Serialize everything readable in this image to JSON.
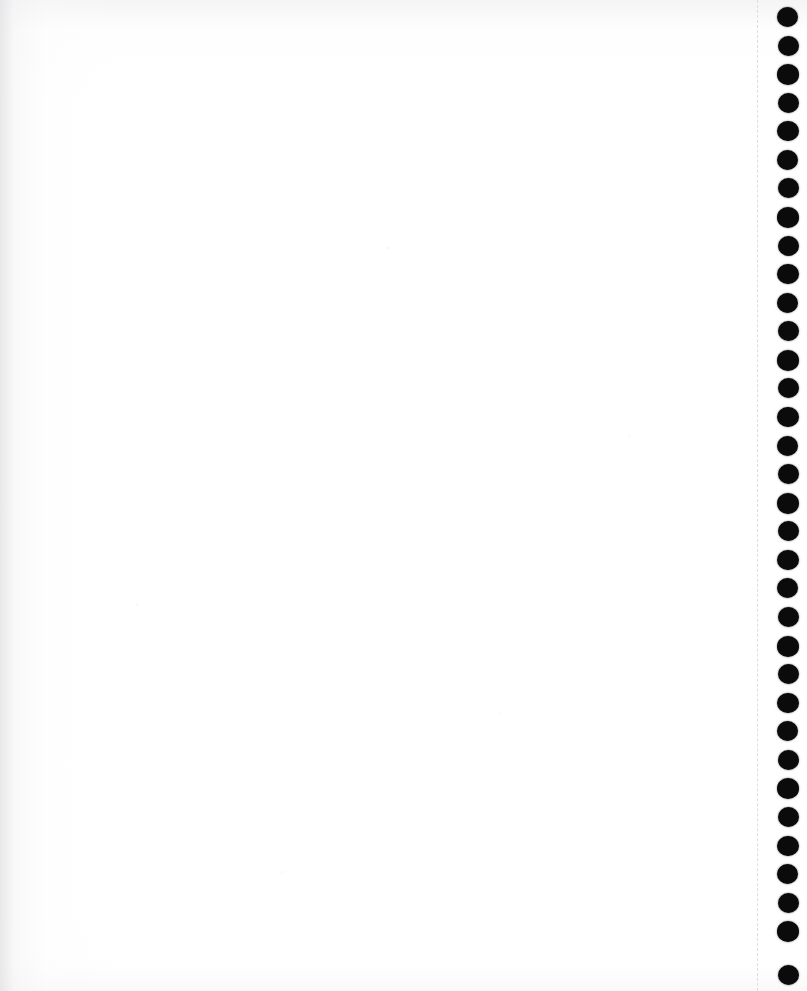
{
  "document": {
    "kind": "scanned-page",
    "page_title": "Blank notebook page (scan)",
    "page_width": 807,
    "page_height": 991,
    "paper_color": "#ffffff",
    "paper_edge_tint": "#e7e7e9",
    "visible_text": ""
  },
  "writing_area": {
    "label": "Blank writing area",
    "content": "",
    "left": 0,
    "width": 757
  },
  "perforation": {
    "label": "Perforated tear line",
    "icon": "dashed-vertical-line-icon",
    "color": "#dedede",
    "x": 757,
    "style": "dashed",
    "thickness": 1.4
  },
  "binding": {
    "label": "Binding hole column",
    "icon": "binding-hole-icon",
    "color": "#0b0b0b",
    "count": 34,
    "center_x": 788,
    "first_center_y": 17,
    "spacing": 28.6,
    "diameter": 20,
    "holes": [
      {
        "cy": 17
      },
      {
        "cy": 46
      },
      {
        "cy": 74
      },
      {
        "cy": 103
      },
      {
        "cy": 131
      },
      {
        "cy": 160
      },
      {
        "cy": 188
      },
      {
        "cy": 217
      },
      {
        "cy": 246
      },
      {
        "cy": 274
      },
      {
        "cy": 303
      },
      {
        "cy": 331
      },
      {
        "cy": 360
      },
      {
        "cy": 388
      },
      {
        "cy": 417
      },
      {
        "cy": 446
      },
      {
        "cy": 474
      },
      {
        "cy": 503
      },
      {
        "cy": 531
      },
      {
        "cy": 560
      },
      {
        "cy": 588
      },
      {
        "cy": 617
      },
      {
        "cy": 646
      },
      {
        "cy": 674
      },
      {
        "cy": 703
      },
      {
        "cy": 731
      },
      {
        "cy": 760
      },
      {
        "cy": 788
      },
      {
        "cy": 817
      },
      {
        "cy": 846
      },
      {
        "cy": 874
      },
      {
        "cy": 903
      },
      {
        "cy": 931
      },
      {
        "cy": 975
      }
    ]
  }
}
